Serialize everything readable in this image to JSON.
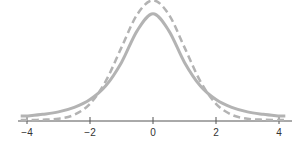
{
  "chart_data": {
    "type": "line",
    "title": "",
    "xlabel": "",
    "ylabel": "",
    "xlim": [
      -4.2,
      4.2
    ],
    "x_ticks": [
      -4,
      -2,
      0,
      2,
      4
    ],
    "x_tick_labels": [
      "−4",
      "−2",
      "0",
      "2",
      "4"
    ],
    "grid": false,
    "legend": null,
    "x": [
      -4,
      -3.5,
      -3,
      -2.5,
      -2,
      -1.5,
      -1,
      -0.5,
      0,
      0.5,
      1,
      1.5,
      2,
      2.5,
      3,
      3.5,
      4
    ],
    "series": [
      {
        "name": "t-distribution (heavier tails)",
        "style": "solid",
        "color": "#b3b3b3",
        "values": [
          0.013,
          0.019,
          0.027,
          0.042,
          0.068,
          0.114,
          0.192,
          0.298,
          0.354,
          0.298,
          0.192,
          0.114,
          0.068,
          0.042,
          0.027,
          0.019,
          0.013
        ]
      },
      {
        "name": "standard normal",
        "style": "dashed",
        "color": "#b3b3b3",
        "values": [
          0.0001,
          0.0009,
          0.0044,
          0.0175,
          0.054,
          0.1295,
          0.242,
          0.352,
          0.399,
          0.352,
          0.242,
          0.1295,
          0.054,
          0.0175,
          0.0044,
          0.0009,
          0.0001
        ]
      }
    ]
  }
}
